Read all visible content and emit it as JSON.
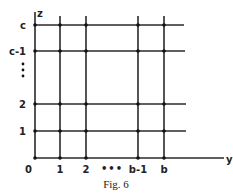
{
  "figure": {
    "caption": "Fig. 6",
    "axes": {
      "horizontal_label": "y",
      "vertical_label": "z"
    },
    "y_ticks": [
      "0",
      "1",
      "2",
      "•••",
      "b-1",
      "b"
    ],
    "z_ticks": [
      "0",
      "1",
      "2",
      "⋮",
      "c-1",
      "c"
    ],
    "colors": {
      "line": "#2a2a2a",
      "background": "#ffffff"
    }
  }
}
